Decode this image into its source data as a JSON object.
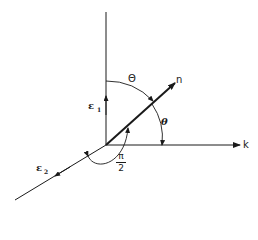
{
  "diagram": {
    "type": "vector-coordinate-diagram",
    "labels": {
      "n": "n",
      "k": "k",
      "e1": "ε",
      "e1_sub": "1",
      "e2": "ε",
      "e2_sub": "2",
      "Theta": "Θ",
      "theta": "θ",
      "pi": "π",
      "two": "2"
    },
    "colors": {
      "ink": "#1a1a1a",
      "background": "#ffffff"
    }
  }
}
